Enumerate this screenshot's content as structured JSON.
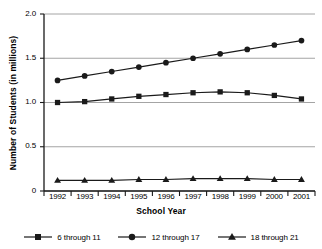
{
  "chart_data": {
    "type": "line",
    "title": "",
    "xlabel": "School Year",
    "ylabel": "Number of Students (in millions)",
    "categories": [
      "1992",
      "1993",
      "1994",
      "1995",
      "1996",
      "1997",
      "1998",
      "1999",
      "2000",
      "2001"
    ],
    "ylim": [
      0,
      2.0
    ],
    "yticks": [
      "0",
      "0.5",
      "1.0",
      "1.5",
      "2.0"
    ],
    "ytick_values": [
      0,
      0.5,
      1.0,
      1.5,
      2.0
    ],
    "grid": "horizontal",
    "legend_position": "bottom",
    "series": [
      {
        "name": "6 through 11",
        "marker": "square",
        "color": "#1a1a1a",
        "values": [
          1.0,
          1.01,
          1.04,
          1.07,
          1.09,
          1.11,
          1.12,
          1.11,
          1.08,
          1.04
        ]
      },
      {
        "name": "12 through 17",
        "marker": "circle",
        "color": "#1a1a1a",
        "values": [
          1.25,
          1.3,
          1.35,
          1.4,
          1.45,
          1.5,
          1.55,
          1.6,
          1.65,
          1.7
        ]
      },
      {
        "name": "18 through 21",
        "marker": "triangle",
        "color": "#1a1a1a",
        "values": [
          0.12,
          0.12,
          0.12,
          0.13,
          0.13,
          0.14,
          0.14,
          0.14,
          0.13,
          0.13
        ]
      }
    ]
  }
}
